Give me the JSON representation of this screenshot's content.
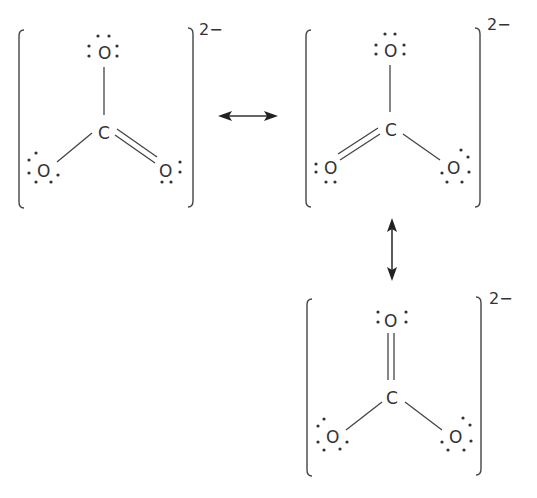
{
  "diagram": {
    "charge_label": "2−",
    "structures": [
      {
        "id": "structure-1",
        "central_atom": "C",
        "atoms": {
          "top": "O",
          "left": "O",
          "right": "O"
        },
        "bonds": {
          "top": "single",
          "left": "single",
          "right": "double"
        },
        "lone_pairs": {
          "top": 3,
          "left": 3,
          "right": 2
        },
        "charge": "2−"
      },
      {
        "id": "structure-2",
        "central_atom": "C",
        "atoms": {
          "top": "O",
          "left": "O",
          "right": "O"
        },
        "bonds": {
          "top": "single",
          "left": "double",
          "right": "single"
        },
        "lone_pairs": {
          "top": 3,
          "left": 2,
          "right": 3
        },
        "charge": "2−"
      },
      {
        "id": "structure-3",
        "central_atom": "C",
        "atoms": {
          "top": "O",
          "left": "O",
          "right": "O"
        },
        "bonds": {
          "top": "double",
          "left": "single",
          "right": "single"
        },
        "lone_pairs": {
          "top": 2,
          "left": 3,
          "right": 3
        },
        "charge": "2−"
      }
    ],
    "arrows": [
      {
        "type": "resonance-double-headed",
        "from": "structure-1",
        "to": "structure-2",
        "orientation": "horizontal"
      },
      {
        "type": "resonance-double-headed",
        "from": "structure-2",
        "to": "structure-3",
        "orientation": "vertical"
      }
    ],
    "colors": {
      "ink": "#333333",
      "background": "#ffffff"
    }
  }
}
